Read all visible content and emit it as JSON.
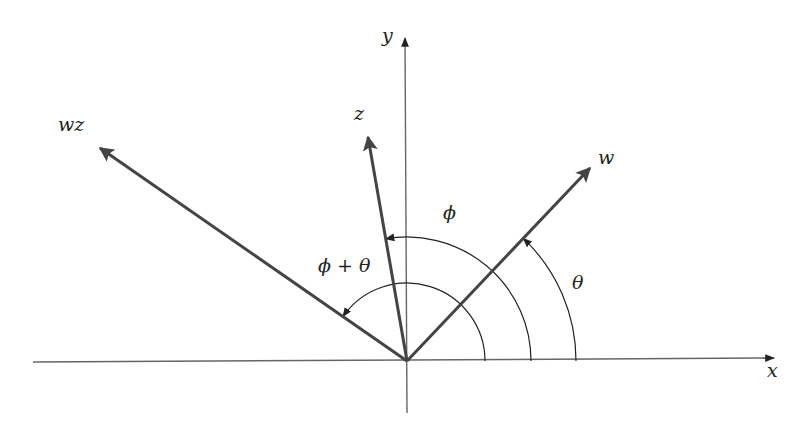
{
  "diagram": {
    "type": "complex-plane-rotation",
    "origin": [
      407,
      361
    ],
    "colors": {
      "axis": "#555555",
      "vector": "#444444",
      "arc": "#222222",
      "text": "#222222"
    },
    "axes": {
      "x_label": "x",
      "y_label": "y"
    },
    "vectors": [
      {
        "name": "w",
        "label": "w",
        "angle_deg": 46.5,
        "tip": [
          590,
          168
        ]
      },
      {
        "name": "z",
        "label": "z",
        "angle_deg": 99.9,
        "tip": [
          368,
          137
        ]
      },
      {
        "name": "wz",
        "label": "wz",
        "angle_deg": 145.2,
        "tip": [
          100,
          148
        ]
      }
    ],
    "arcs": [
      {
        "name": "theta",
        "label": "θ",
        "radius": 169,
        "from_deg": 0,
        "to_deg": 46.5
      },
      {
        "name": "phi",
        "label": "ϕ",
        "radius": 124,
        "from_deg": 0,
        "to_deg": 99.9
      },
      {
        "name": "phi-plus-theta",
        "label": "ϕ + θ",
        "radius": 78,
        "from_deg": 0,
        "to_deg": 145.2
      }
    ]
  }
}
